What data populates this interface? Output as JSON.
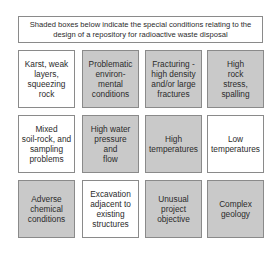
{
  "header": {
    "text": "Shaded boxes below indicate the special conditions relating to the design of a repository for radioactive waste disposal"
  },
  "colors": {
    "shaded": "#c9c9c9",
    "plain": "#ffffff",
    "border": "#8a8a8a"
  },
  "grid": {
    "rows": [
      [
        {
          "label": "Karst, weak\nlayers,\nsqueezing\nrock",
          "shaded": false
        },
        {
          "label": "Problematic\nenviron-\nmental\nconditions",
          "shaded": true
        },
        {
          "label": "Fracturing -\nhigh density\nand/or large\nfractures",
          "shaded": true
        },
        {
          "label": "High\nrock\nstress,\nspalling",
          "shaded": true
        }
      ],
      [
        {
          "label": "Mixed\nsoil-rock, and\nsampling\nproblems",
          "shaded": false
        },
        {
          "label": "High water\npressure\nand\nflow",
          "shaded": true
        },
        {
          "label": "High\ntemperatures",
          "shaded": true
        },
        {
          "label": "Low\ntemperatures",
          "shaded": false
        }
      ],
      [
        {
          "label": "Adverse\nchemical\nconditions",
          "shaded": true
        },
        {
          "label": "Excavation\nadjacent to\nexisting\nstructures",
          "shaded": false
        },
        {
          "label": "Unusual\nproject\nobjective",
          "shaded": true
        },
        {
          "label": "Complex\ngeology",
          "shaded": true
        }
      ]
    ]
  }
}
